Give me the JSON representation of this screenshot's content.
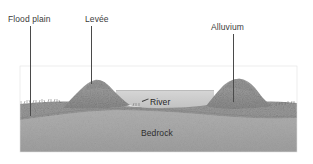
{
  "figure": {
    "callouts": [
      {
        "id": "flood-plain",
        "label": "Flood plain"
      },
      {
        "id": "levee",
        "label": "Levée"
      },
      {
        "id": "alluvium",
        "label": "Alluvium"
      }
    ],
    "inner_labels": [
      {
        "id": "river",
        "label": "River"
      },
      {
        "id": "bedrock",
        "label": "Bedrock"
      }
    ],
    "colors": {
      "background": "#ffffff",
      "bedrock": "#a9a9a9",
      "alluvium": "#9d9d9d",
      "alluvium_mound": "#989898",
      "river_water": "#cfcfcf",
      "leader_line": "#4a4a4a",
      "label_text": "#3a3a3a",
      "inner_label_text": "#2b2b2b",
      "ground_line": "#6e6e6e"
    }
  }
}
